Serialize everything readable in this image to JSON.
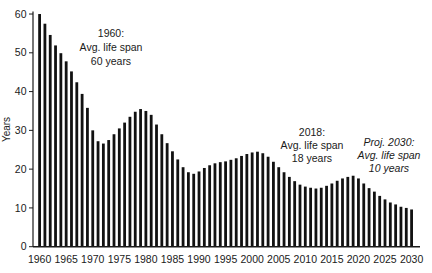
{
  "chart_data": {
    "type": "bar",
    "title": "",
    "xlabel": "",
    "ylabel": "Years",
    "ylim": [
      0,
      60
    ],
    "y_ticks": [
      0,
      10,
      20,
      30,
      40,
      50,
      60
    ],
    "x_ticks": [
      1960,
      1965,
      1970,
      1975,
      1980,
      1985,
      1990,
      1995,
      2000,
      2005,
      2010,
      2015,
      2020,
      2025,
      2030
    ],
    "bar_color": "#111111",
    "axis_color": "#1a1a1a",
    "grid": "off",
    "years": [
      1960,
      1961,
      1962,
      1963,
      1964,
      1965,
      1966,
      1967,
      1968,
      1969,
      1970,
      1971,
      1972,
      1973,
      1974,
      1975,
      1976,
      1977,
      1978,
      1979,
      1980,
      1981,
      1982,
      1983,
      1984,
      1985,
      1986,
      1987,
      1988,
      1989,
      1990,
      1991,
      1992,
      1993,
      1994,
      1995,
      1996,
      1997,
      1998,
      1999,
      2000,
      2001,
      2002,
      2003,
      2004,
      2005,
      2006,
      2007,
      2008,
      2009,
      2010,
      2011,
      2012,
      2013,
      2014,
      2015,
      2016,
      2017,
      2018,
      2019,
      2020,
      2021,
      2022,
      2023,
      2024,
      2025,
      2026,
      2027,
      2028,
      2029,
      2030
    ],
    "values": [
      60,
      57.5,
      54.6,
      51.9,
      49.9,
      47.8,
      45.2,
      42.4,
      39.4,
      35.8,
      30,
      27.2,
      26.6,
      27.5,
      29,
      30.5,
      32,
      33.5,
      34.8,
      35.5,
      35,
      34,
      31.5,
      29,
      26.7,
      24.6,
      22.5,
      20.5,
      19.2,
      18.8,
      19.4,
      20.3,
      21,
      21.5,
      21.8,
      22,
      22.4,
      22.8,
      23.4,
      23.9,
      24.3,
      24.5,
      24.1,
      23.2,
      21.9,
      20.5,
      19.2,
      18,
      16.9,
      16,
      15.5,
      15.2,
      15,
      15.2,
      15.7,
      16.3,
      17,
      17.6,
      18,
      18.3,
      17.6,
      16.3,
      15.1,
      14.2,
      13.1,
      12.2,
      11.4,
      10.9,
      10.3,
      10,
      9.6
    ],
    "annotations": [
      {
        "lines": [
          "1960:",
          "Avg. life span",
          "60 years"
        ],
        "style": "normal"
      },
      {
        "lines": [
          "2018:",
          "Avg. life span",
          "18 years"
        ],
        "style": "normal"
      },
      {
        "lines": [
          "Proj. 2030:",
          "Avg. life span",
          "10 years"
        ],
        "style": "italic"
      }
    ]
  }
}
